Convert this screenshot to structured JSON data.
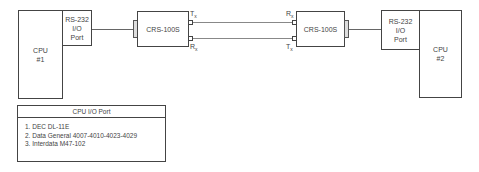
{
  "diagram": {
    "cpu1": {
      "line1": "CPU",
      "line2": "#1"
    },
    "cpu2": {
      "line1": "CPU",
      "line2": "#2"
    },
    "rs232_left": {
      "line1": "RS-232",
      "line2": "I/O",
      "line3": "Port"
    },
    "rs232_right": {
      "line1": "RS-232",
      "line2": "I/O",
      "line3": "Port"
    },
    "crs_left": {
      "label": "CRS-100S",
      "tx": "T",
      "rx": "R",
      "sub": "x"
    },
    "crs_right": {
      "label": "CRS-100S",
      "tx": "T",
      "rx": "R",
      "sub": "x"
    }
  },
  "table": {
    "title": "CPU I/O Port",
    "items": [
      "1. DEC DL-11E",
      "2. Data General 4007-4010-4023-4029",
      "3. Interdata M47-102"
    ]
  }
}
